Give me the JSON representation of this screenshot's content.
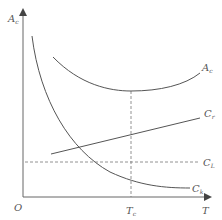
{
  "diagram": {
    "type": "economics-cost-curves",
    "y_axis": {
      "label": "A",
      "label_sub": "c"
    },
    "x_axis": {
      "label": "T"
    },
    "origin_label": "O",
    "marker": {
      "label": "T",
      "label_sub": "c"
    },
    "curves": [
      {
        "id": "A_c",
        "label": "A",
        "label_sub": "c",
        "shape": "U-shaped",
        "style": "solid"
      },
      {
        "id": "C_r",
        "label": "C",
        "label_sub": "r",
        "shape": "rising line",
        "style": "solid"
      },
      {
        "id": "C_L",
        "label": "C",
        "label_sub": "L",
        "shape": "horizontal line",
        "style": "dashed"
      },
      {
        "id": "C_k",
        "label": "C",
        "label_sub": "k",
        "shape": "decreasing curve",
        "style": "solid"
      }
    ],
    "colors": {
      "line": "#555555",
      "dashed": "#777777",
      "background": "#ffffff"
    }
  }
}
